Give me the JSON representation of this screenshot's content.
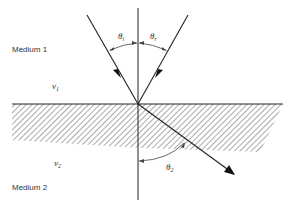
{
  "diagram": {
    "type": "refraction-reflection",
    "media": [
      {
        "label": "Medium 1",
        "velocity_label": "v",
        "velocity_sub": "1"
      },
      {
        "label": "Medium 2",
        "velocity_label": "v",
        "velocity_sub": "2"
      }
    ],
    "angles": {
      "incident": {
        "symbol": "θ",
        "sub": "i"
      },
      "reflected": {
        "symbol": "θ",
        "sub": "r"
      },
      "refracted": {
        "symbol": "θ",
        "sub": "2"
      }
    },
    "rays": [
      {
        "name": "incident-ray",
        "from": [
          87,
          15
        ],
        "to": [
          138,
          104
        ]
      },
      {
        "name": "reflected-ray",
        "from": [
          138,
          104
        ],
        "to": [
          188,
          15
        ]
      },
      {
        "name": "refracted-ray",
        "from": [
          138,
          104
        ],
        "to": [
          234,
          174
        ]
      }
    ],
    "normal": {
      "x": 138,
      "y1": 8,
      "y2": 200
    },
    "interface": {
      "y": 104,
      "x1": 12,
      "x2": 283
    },
    "colors": {
      "line": "#222222",
      "hatch": "#555555",
      "text": "#333333"
    }
  }
}
